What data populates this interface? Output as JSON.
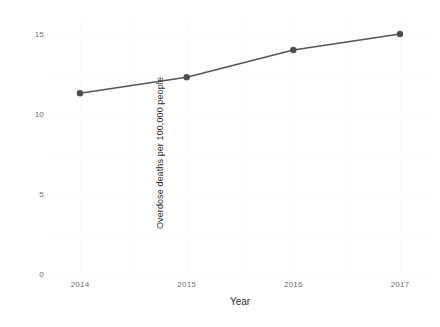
{
  "chart_data": {
    "type": "line",
    "title": "",
    "subtitle": "",
    "xlabel": "Year",
    "ylabel": "Overdose deaths per 100,000 people",
    "x": [
      2014,
      2015,
      2016,
      2017
    ],
    "categories": [
      "2014",
      "2015",
      "2016",
      "2017"
    ],
    "values": [
      11.3,
      12.3,
      14.0,
      15.0
    ],
    "series": [
      {
        "name": "Overdose deaths",
        "values": [
          11.3,
          12.3,
          14.0,
          15.0
        ]
      }
    ],
    "xlim": [
      2013.7,
      2017.3
    ],
    "ylim": [
      0,
      16
    ],
    "x_ticks": [
      "2014",
      "2015",
      "2016",
      "2017"
    ],
    "y_ticks": [
      "0",
      "5",
      "10",
      "15"
    ],
    "y_tick_values": [
      0,
      5,
      10,
      15
    ],
    "grid": true,
    "legend": "none",
    "marker": "circle",
    "colors": {
      "line": "#555555",
      "point": "#4d4d4d",
      "panel_background": "#ffffff",
      "grid_major": "#fbfbfb",
      "grid_minor": "#fdfdfd",
      "axis_text": "#6e6e6e",
      "axis_title": "#2b2b2b"
    }
  }
}
